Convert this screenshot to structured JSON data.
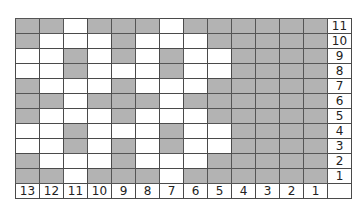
{
  "chart_data": {
    "type": "table",
    "title": "",
    "columns": [
      "13",
      "12",
      "11",
      "10",
      "9",
      "8",
      "7",
      "6",
      "5",
      "4",
      "3",
      "2",
      "1"
    ],
    "rows": [
      "11",
      "10",
      "9",
      "8",
      "7",
      "6",
      "5",
      "4",
      "3",
      "2",
      "1"
    ],
    "shade_color": "#b3b3b3",
    "cells": [
      [
        1,
        1,
        0,
        1,
        1,
        1,
        0,
        1,
        1,
        1,
        1,
        1,
        1
      ],
      [
        1,
        0,
        0,
        0,
        1,
        0,
        0,
        0,
        1,
        1,
        1,
        1,
        1
      ],
      [
        0,
        0,
        1,
        0,
        1,
        0,
        1,
        0,
        0,
        1,
        1,
        1,
        1
      ],
      [
        0,
        0,
        1,
        0,
        0,
        0,
        1,
        0,
        0,
        1,
        1,
        1,
        1
      ],
      [
        1,
        0,
        0,
        0,
        1,
        0,
        0,
        0,
        1,
        1,
        1,
        1,
        1
      ],
      [
        1,
        1,
        0,
        1,
        1,
        1,
        0,
        1,
        1,
        1,
        1,
        1,
        1
      ],
      [
        1,
        0,
        0,
        0,
        1,
        0,
        0,
        0,
        1,
        1,
        1,
        1,
        1
      ],
      [
        0,
        0,
        1,
        0,
        0,
        0,
        1,
        0,
        0,
        1,
        1,
        1,
        1
      ],
      [
        0,
        0,
        1,
        0,
        1,
        0,
        1,
        0,
        0,
        1,
        1,
        1,
        1
      ],
      [
        1,
        0,
        0,
        0,
        1,
        0,
        0,
        0,
        1,
        1,
        1,
        1,
        1
      ],
      [
        1,
        1,
        0,
        1,
        1,
        1,
        0,
        1,
        1,
        1,
        1,
        1,
        1
      ]
    ]
  }
}
